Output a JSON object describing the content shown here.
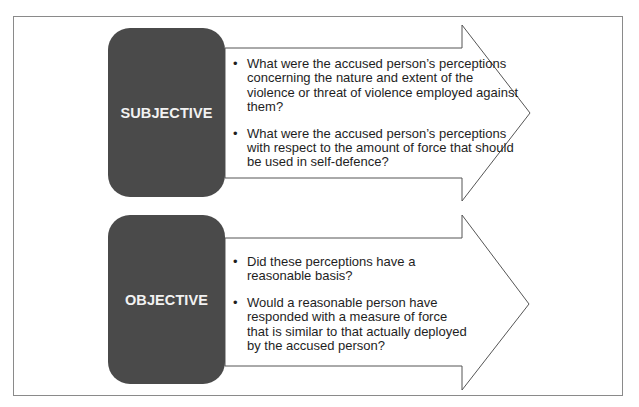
{
  "diagram": {
    "rows": [
      {
        "label": "SUBJECTIVE",
        "bullets": [
          "What were the accused person’s perceptions concerning the nature and extent of the violence or threat of violence employed against them?",
          "What were the accused person’s perceptions with respect to the amount of force that should be used in self-defence?"
        ]
      },
      {
        "label": "OBJECTIVE",
        "bullets": [
          "Did these perceptions have a reasonable basis?",
          "Would a reasonable person have responded with a measure of force that is similar to that actually deployed by the accused person?"
        ]
      }
    ],
    "colors": {
      "label_box": "#4a4a4a",
      "label_text": "#f2f2f2",
      "arrow_stroke": "#555555",
      "frame_border": "#8a8a8a"
    }
  }
}
